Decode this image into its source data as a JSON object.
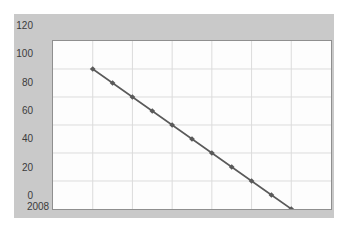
{
  "chart_data": {
    "type": "line",
    "title": "",
    "subtitle": "",
    "xlabel": "",
    "ylabel": "",
    "x": [
      2010,
      2011,
      2012,
      2013,
      2014,
      2015,
      2016,
      2017,
      2018,
      2019,
      2020
    ],
    "values": [
      100,
      90,
      80,
      70,
      60,
      50,
      40,
      30,
      20,
      10,
      0
    ],
    "series": [
      {
        "name": "",
        "values": [
          100,
          90,
          80,
          70,
          60,
          50,
          40,
          30,
          20,
          10,
          0
        ]
      }
    ],
    "xlim": [
      2008,
      2022
    ],
    "ylim": [
      0,
      120
    ],
    "x_ticks": [
      "2008",
      "2010",
      "2012",
      "2014",
      "2016",
      "2018",
      "2020",
      "2022"
    ],
    "x_tick_values": [
      2008,
      2010,
      2012,
      2014,
      2016,
      2018,
      2020,
      2022
    ],
    "y_ticks": [
      "0",
      "20",
      "40",
      "60",
      "80",
      "100",
      "120"
    ],
    "y_tick_values": [
      0,
      20,
      40,
      60,
      80,
      100,
      120
    ],
    "grid": true,
    "legend": false,
    "legend_position": "none",
    "marker": "diamond",
    "annotations": [],
    "colors": {
      "line": "#5a5a5a",
      "marker": "#5a5a5a",
      "grid": "#dcdcdc",
      "plot_background": "#fdfdfd",
      "chart_background": "#c9c9c9",
      "axis_border": "#8f8f8f",
      "tick_label": "#3b3b3b"
    }
  }
}
